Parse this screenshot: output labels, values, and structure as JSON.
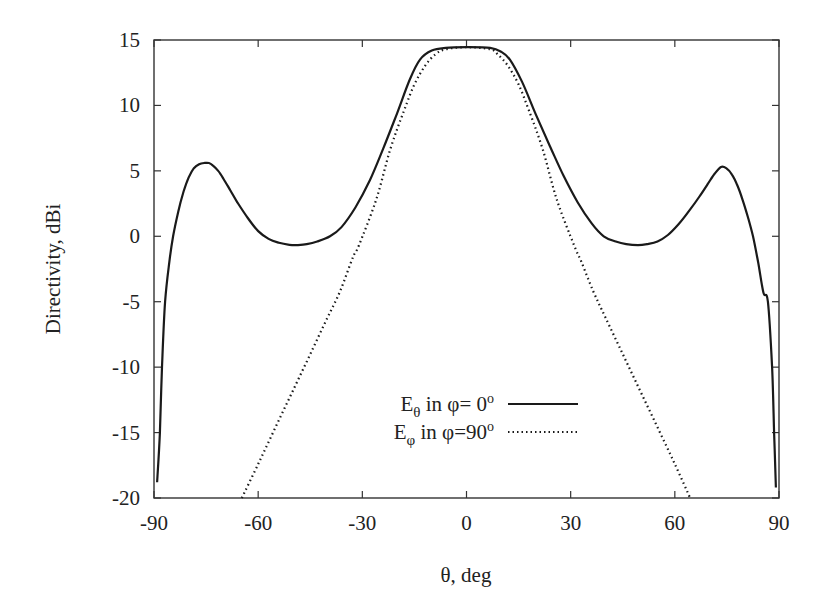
{
  "chart_data": {
    "type": "line",
    "title": "",
    "xlabel": "θ, deg",
    "ylabel": "Directivity, dBi",
    "xlim": [
      -90,
      90
    ],
    "ylim": [
      -20,
      15
    ],
    "xticks": [
      -90,
      -60,
      -30,
      0,
      30,
      60,
      90
    ],
    "yticks": [
      15,
      10,
      5,
      0,
      -5,
      -10,
      -15,
      -20
    ],
    "grid": false,
    "legend_position": "lower center",
    "series": [
      {
        "name": "Eθ in φ= 0°",
        "legend_main": "E",
        "legend_sub": "θ",
        "legend_rest": " in φ=  0",
        "legend_sup": "o",
        "style": "solid",
        "x": [
          -89.1,
          -88.3,
          -87.7,
          -86.8,
          -85.5,
          -84.5,
          -83.0,
          -81.5,
          -80.0,
          -78.5,
          -77.0,
          -75.5,
          -74.2,
          -73.0,
          -71.5,
          -70.0,
          -68.0,
          -66.0,
          -63.0,
          -60.0,
          -57.0,
          -54.0,
          -51.0,
          -48.8,
          -46.0,
          -43.0,
          -39.3,
          -36.0,
          -32.0,
          -27.8,
          -24.0,
          -20.0,
          -16.3,
          -13.4,
          -10.0,
          -6.0,
          0.0,
          6.8,
          10.0,
          12.5,
          16.0,
          20.0,
          24.0,
          28.0,
          32.0,
          36.0,
          39.5,
          43.0,
          46.0,
          49.4,
          52.0,
          55.0,
          58.0,
          61.0,
          64.0,
          67.0,
          69.5,
          71.5,
          73.3,
          74.8,
          76.5,
          78.0,
          79.5,
          81.0,
          82.5,
          84.0,
          85.5,
          86.8,
          88.0,
          88.6,
          89.1
        ],
        "y": [
          -18.8,
          -15.0,
          -10.0,
          -5.0,
          -1.8,
          0.0,
          1.9,
          3.4,
          4.5,
          5.2,
          5.5,
          5.6,
          5.6,
          5.4,
          5.0,
          4.4,
          3.5,
          2.6,
          1.4,
          0.4,
          -0.2,
          -0.5,
          -0.65,
          -0.67,
          -0.6,
          -0.4,
          0.0,
          0.7,
          2.2,
          4.3,
          6.7,
          9.4,
          12.0,
          13.5,
          14.2,
          14.4,
          14.45,
          14.4,
          14.1,
          13.5,
          11.8,
          9.3,
          6.9,
          4.6,
          2.6,
          1.0,
          0.0,
          -0.4,
          -0.6,
          -0.67,
          -0.6,
          -0.4,
          0.1,
          0.9,
          1.9,
          3.0,
          4.0,
          4.8,
          5.3,
          5.2,
          4.7,
          3.9,
          2.8,
          1.5,
          0.0,
          -2.0,
          -4.3,
          -5.0,
          -10.0,
          -15.0,
          -19.2
        ]
      },
      {
        "name": "Eφ in φ=90°",
        "legend_main": "E",
        "legend_sub": "φ",
        "legend_rest": " in φ=90",
        "legend_sup": "o",
        "style": "dotted",
        "x": [
          -64.7,
          -60.0,
          -55.0,
          -50.0,
          -45.0,
          -40.0,
          -36.4,
          -32.7,
          -31.0,
          -26.0,
          -22.0,
          -18.0,
          -15.0,
          -12.0,
          -9.0,
          -6.0,
          0.0,
          6.8,
          9.0,
          12.0,
          15.0,
          18.0,
          22.0,
          26.0,
          31.0,
          33.0,
          36.5,
          40.0,
          45.0,
          50.0,
          55.0,
          60.0,
          64.4
        ],
        "y": [
          -20.0,
          -17.4,
          -14.6,
          -11.8,
          -9.0,
          -6.2,
          -4.2,
          -1.6,
          -0.7,
          2.8,
          6.6,
          9.6,
          11.6,
          13.0,
          13.9,
          14.3,
          14.45,
          14.3,
          13.9,
          13.0,
          11.6,
          9.6,
          6.6,
          2.8,
          -0.7,
          -1.9,
          -4.2,
          -6.2,
          -9.0,
          -11.8,
          -14.6,
          -17.4,
          -20.0
        ]
      }
    ]
  },
  "plot_area": {
    "left": 154,
    "top": 40,
    "right": 779,
    "bottom": 498
  },
  "colors": {
    "line": "#1a1a1a",
    "axis": "#333333",
    "background": "#ffffff"
  },
  "legend": {
    "items": [
      {
        "index": 0,
        "line_x1": 508,
        "line_x2": 578,
        "y": 404
      },
      {
        "index": 1,
        "line_x1": 508,
        "line_x2": 578,
        "y": 432
      }
    ]
  }
}
